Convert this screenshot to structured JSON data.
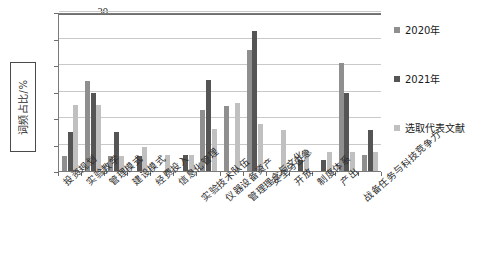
{
  "chart_data": {
    "type": "bar",
    "title": "",
    "xlabel": "",
    "ylabel": "词频占比/%",
    "ylim": [
      0,
      30
    ],
    "yticks": [
      0,
      5,
      10,
      15,
      20,
      25,
      30
    ],
    "grid": true,
    "legend_position": "right",
    "categories": [
      "投资规划",
      "实验教学",
      "管理模式",
      "建设模式",
      "经费投入",
      "信息化管理",
      "实验技术队伍",
      "仪器设备资产",
      "管理理念与文化",
      "安全与应急",
      "开放",
      "制度体系",
      "产出",
      "战备任务与科技竞争力"
    ],
    "series": [
      {
        "name": "2020年",
        "color": "#8f8f8f",
        "values": [
          2.9,
          17.0,
          2.9,
          0.0,
          0.0,
          0.0,
          11.6,
          12.3,
          22.8,
          0.0,
          0.0,
          0.0,
          20.3,
          3.0
        ]
      },
      {
        "name": "2021年",
        "color": "#555555",
        "values": [
          7.3,
          14.7,
          7.3,
          2.9,
          0.0,
          3.0,
          17.1,
          0.0,
          26.5,
          0.0,
          2.0,
          2.0,
          14.8,
          7.8
        ]
      },
      {
        "name": "选取代表文献",
        "color": "#c0c0c0",
        "values": [
          12.4,
          12.4,
          2.9,
          4.6,
          3.0,
          3.0,
          7.9,
          12.8,
          8.9,
          7.8,
          3.6,
          3.6,
          3.6,
          3.5
        ]
      }
    ]
  },
  "legend": {
    "items": [
      {
        "label": "2020年",
        "color": "#8f8f8f"
      },
      {
        "label": "2021年",
        "color": "#555555"
      },
      {
        "label": "选取代表文献",
        "color": "#c0c0c0"
      }
    ]
  },
  "axis": {
    "y_title": "词频占比/%",
    "y_tick_labels": [
      "30",
      "25",
      "20",
      "15",
      "10",
      "5",
      "0"
    ]
  }
}
